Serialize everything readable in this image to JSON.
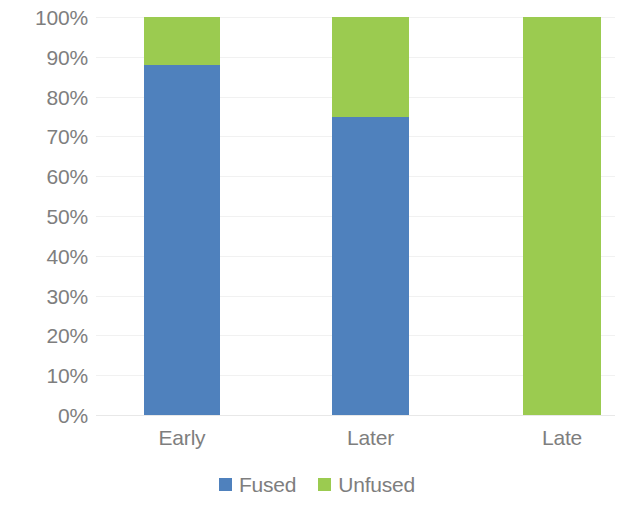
{
  "chart_data": {
    "type": "bar",
    "subtype": "stacked-100-percent",
    "title": "",
    "subtitle": "",
    "xlabel": "",
    "ylabel": "",
    "categories": [
      "Early",
      "Later",
      "Late"
    ],
    "series": [
      {
        "name": "Fused",
        "values": [
          88,
          75,
          0
        ],
        "color": "#4f81bd"
      },
      {
        "name": "Unfused",
        "values": [
          12,
          25,
          100
        ],
        "color": "#9bcb50"
      }
    ],
    "ylim": [
      0,
      100
    ],
    "ytick_values": [
      0,
      10,
      20,
      30,
      40,
      50,
      60,
      70,
      80,
      90,
      100
    ],
    "ytick_labels": [
      "0%",
      "10%",
      "20%",
      "30%",
      "40%",
      "50%",
      "60%",
      "70%",
      "80%",
      "90%",
      "100%"
    ],
    "grid": true,
    "grid_axis": "y",
    "grid_color": "#f1f1f1",
    "legend_position": "bottom",
    "legend_entries": [
      {
        "label": "Fused",
        "color": "#4f81bd",
        "swatch": "square-swatch"
      },
      {
        "label": "Unfused",
        "color": "#9bcb50",
        "swatch": "square-swatch"
      }
    ],
    "axis_text_color": "#7e7e7e",
    "background_color": "#ffffff"
  }
}
